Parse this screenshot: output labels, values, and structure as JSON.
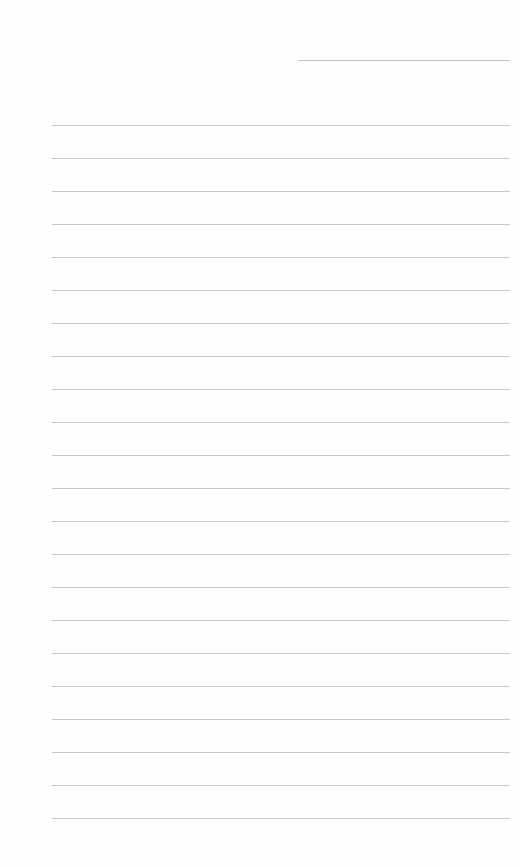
{
  "page": {
    "type": "lined-paper",
    "background": "#fefefe",
    "line_color": "#c9c9c9"
  },
  "header_line": {
    "x1": 298,
    "x2": 510,
    "y": 60
  },
  "ruled_lines": {
    "x1": 52,
    "x2": 510,
    "y_positions": [
      125,
      158,
      191,
      224,
      257,
      290,
      323,
      356,
      389,
      422,
      455,
      488,
      521,
      554,
      587,
      620,
      653,
      686,
      719,
      752,
      785,
      818
    ]
  }
}
